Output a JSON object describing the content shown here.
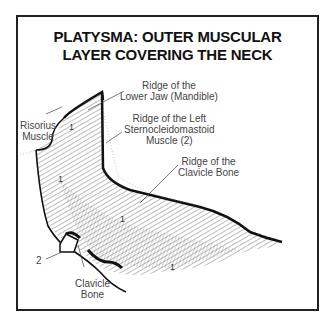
{
  "title": {
    "line1": "PLATYSMA: OUTER MUSCULAR",
    "line2": "LAYER COVERING THE NECK"
  },
  "labels": {
    "mandible": {
      "line1": "Ridge of the",
      "line2": "Lower Jaw (Mandible)"
    },
    "sternocleidomastoid": {
      "line1": "Ridge of the Left",
      "line2": "Sternocleidomastoid",
      "line3": "Muscle (2)"
    },
    "clavicle_ridge": {
      "line1": "Ridge of the",
      "line2": "Clavicle Bone"
    },
    "risorius": {
      "line1": "Risorius",
      "line2": "Muscle"
    },
    "clavicle_bone": {
      "line1": "Clavicle",
      "line2": "Bone"
    },
    "marker_2": "2"
  },
  "region_markers": [
    "1",
    "1",
    "1",
    "1"
  ],
  "colors": {
    "ink": "#222222",
    "label": "#444444",
    "background": "#ffffff"
  }
}
